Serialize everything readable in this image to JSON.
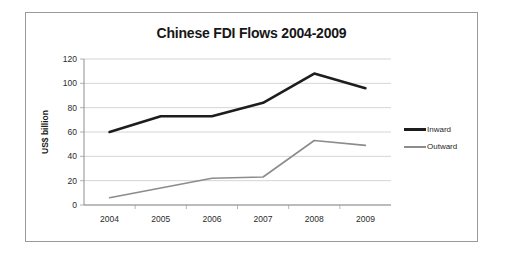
{
  "chart_data": {
    "type": "line",
    "title": "Chinese FDI Flows 2004-2009",
    "xlabel": "",
    "ylabel": "US$ billion",
    "categories": [
      "2004",
      "2005",
      "2006",
      "2007",
      "2008",
      "2009"
    ],
    "series": [
      {
        "name": "Inward",
        "values": [
          60,
          73,
          73,
          84,
          108,
          96
        ],
        "color": "#1d1d1d"
      },
      {
        "name": "Outward",
        "values": [
          6,
          14,
          22,
          23,
          53,
          49
        ],
        "color": "#8c8c8c"
      }
    ],
    "ylim": [
      0,
      120
    ],
    "yticks": [
      0,
      20,
      40,
      60,
      80,
      100,
      120
    ],
    "ytick_labels": [
      "0",
      "20",
      "40",
      "60",
      "80",
      "100",
      "120"
    ],
    "grid": true,
    "legend_position": "right"
  },
  "legend": {
    "entries": [
      {
        "label": "Inward"
      },
      {
        "label": "Outward"
      }
    ]
  }
}
